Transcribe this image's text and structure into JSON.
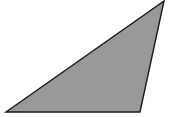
{
  "canvas": {
    "width": 175,
    "height": 117,
    "background_color": "#ffffff",
    "title": "Scalene triangle figure"
  },
  "figure": {
    "name": "triangle",
    "kind": "polygon",
    "sides": 3,
    "fill_color": "#999999",
    "stroke_color": "#1a1a1a",
    "stroke_width": 1.4,
    "vertices": [
      {
        "label": "bottom-left",
        "x": 6,
        "y": 112
      },
      {
        "label": "bottom-right",
        "x": 140,
        "y": 112
      },
      {
        "label": "apex-top-right",
        "x": 164,
        "y": 1
      }
    ],
    "points_attr": "6,112 140,112 164,1"
  },
  "chart_data": {
    "type": "scatter",
    "title": "",
    "subtitle": "",
    "xlabel": "",
    "ylabel": "",
    "grid": false,
    "legend": null,
    "annotations": [],
    "x": [
      6,
      140,
      164,
      6
    ],
    "y": [
      112,
      112,
      1,
      112
    ],
    "xlim": [
      0,
      175
    ],
    "ylim": [
      0,
      117
    ],
    "series": [
      {
        "name": "triangle-outline",
        "closed": true,
        "fill": "#999999",
        "stroke": "#1a1a1a",
        "points": [
          [
            6,
            112
          ],
          [
            140,
            112
          ],
          [
            164,
            1
          ]
        ]
      }
    ]
  }
}
